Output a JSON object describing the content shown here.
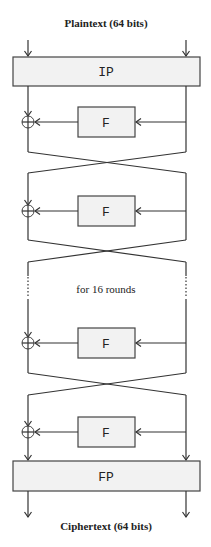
{
  "diagram": {
    "title_top": "Plaintext (64 bits)",
    "title_bottom": "Ciphertext (64 bits)",
    "initial_permutation": "IP",
    "final_permutation": "FP",
    "round_function": "F",
    "repeat_note": "for 16 rounds",
    "rounds_shown": [
      {
        "f_label": "F"
      },
      {
        "f_label": "F"
      },
      {
        "f_label": "F"
      },
      {
        "f_label": "F"
      }
    ],
    "colors": {
      "box_fill": "#f2f2f2",
      "line": "#333333",
      "background": "#ffffff"
    }
  }
}
